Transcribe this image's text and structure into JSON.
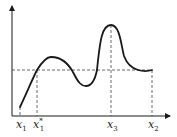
{
  "diagram": {
    "type": "function-graph",
    "axes": {
      "x_axis": {
        "from": [
          12,
          116
        ],
        "to": [
          170,
          116
        ],
        "arrow": true
      },
      "y_axis": {
        "from": [
          12,
          116
        ],
        "to": [
          12,
          6
        ],
        "arrow": true
      }
    },
    "curve": {
      "color": "#1a1a1a",
      "path": "M20,107 C27,92 32,80 37,70 C42,62 46,57 51,57 C60,57 68,62 74,74 C78,82 81,86 86,86 C92,86 95,80 97,70 C100,40 102,25 111,25 C120,25 121,45 124,56 C127,64 131,68 138,70 C145,72 149,71 152,70"
    },
    "dashed_lines": [
      {
        "name": "level-line",
        "from": [
          12,
          70
        ],
        "to": [
          152,
          70
        ]
      },
      {
        "name": "x1-star-guide",
        "from": [
          37,
          70
        ],
        "to": [
          37,
          116
        ]
      },
      {
        "name": "x3-guide",
        "from": [
          111,
          25
        ],
        "to": [
          111,
          116
        ]
      },
      {
        "name": "x2-guide",
        "from": [
          152,
          70
        ],
        "to": [
          152,
          116
        ]
      },
      {
        "name": "x1-guide",
        "from": [
          20,
          107
        ],
        "to": [
          20,
          116
        ]
      }
    ],
    "labels": [
      {
        "name": "label-x1",
        "base": "x",
        "subscript": "1",
        "superscript": "",
        "x": 16,
        "y": 128
      },
      {
        "name": "label-x1-star",
        "base": "x",
        "subscript": "1",
        "superscript": "*",
        "x": 33,
        "y": 128
      },
      {
        "name": "label-x3",
        "base": "x",
        "subscript": "3",
        "superscript": "",
        "x": 107,
        "y": 128
      },
      {
        "name": "label-x2",
        "base": "x",
        "subscript": "2",
        "superscript": "",
        "x": 148,
        "y": 128
      }
    ],
    "colors": {
      "line": "#1a1a1a",
      "dash": "#444444",
      "background": "#ffffff"
    }
  }
}
